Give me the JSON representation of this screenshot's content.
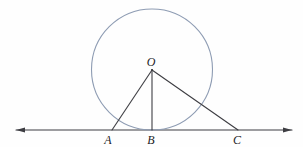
{
  "figure": {
    "labels": {
      "o": "O",
      "a": "A",
      "b": "B",
      "c": "C"
    },
    "colors": {
      "segment": "#3d3d42",
      "baseline": "#3d3d42",
      "circle": "#8e9cb3",
      "label": "#222226",
      "background": "#fefefe"
    },
    "geometry": {
      "width": 303,
      "height": 147,
      "circle": {
        "cx": 152,
        "cy": 69.5,
        "r": 60.5
      },
      "baseline": {
        "x1": 16,
        "x2": 292,
        "y": 130
      },
      "vertex": {
        "x": 152,
        "y": 70
      },
      "feet": {
        "a": 112,
        "b": 152,
        "c": 238
      },
      "label_pos": {
        "o": {
          "x": 151,
          "y": 66
        },
        "a": {
          "x": 108,
          "y": 144
        },
        "b": {
          "x": 151,
          "y": 144
        },
        "c": {
          "x": 237,
          "y": 144
        }
      },
      "arrow": {
        "length": 9,
        "half_width": 2.6
      }
    }
  }
}
